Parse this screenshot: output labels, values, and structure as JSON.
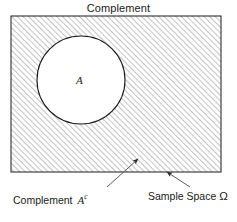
{
  "figure": {
    "title": "Complement",
    "region_label": "A",
    "labels": {
      "complement": "Complement",
      "complement_set": "A",
      "complement_superscript": "c",
      "sample_space": "Sample Space",
      "sample_space_symbol": "Ω"
    },
    "colors": {
      "stroke": "#1a1a1a",
      "hatch": "#8c8c8c",
      "background": "#ffffff",
      "circle_fill": "#ffffff",
      "leader": "#4d4d4d"
    },
    "geometry": {
      "rect": {
        "x": 11,
        "y": 16,
        "width": 210,
        "height": 156
      },
      "circle": {
        "cx": 81,
        "cy": 80,
        "r": 44
      },
      "hatch_angle_deg": 45,
      "hatch_spacing_px": 4
    },
    "annotations": [
      {
        "name": "complement-callout",
        "text": "Complement A^c",
        "arrow_from": {
          "x": 107,
          "y": 187
        },
        "arrow_to": {
          "x": 138,
          "y": 159
        }
      },
      {
        "name": "sample-space-callout",
        "text": "Sample Space Ω",
        "arrow_from": {
          "x": 190,
          "y": 187
        },
        "arrow_to": {
          "x": 166,
          "y": 172
        }
      }
    ]
  }
}
